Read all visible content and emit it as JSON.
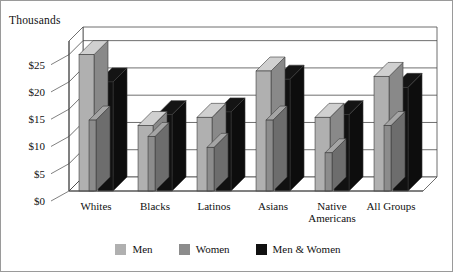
{
  "axis_caption": "Thousands",
  "chart_data": {
    "type": "bar",
    "title": "",
    "subtitle": "",
    "xlabel": "",
    "ylabel": "Thousands",
    "ylim": [
      0,
      27.5
    ],
    "yticks": [
      0,
      5,
      10,
      15,
      20,
      25
    ],
    "ytick_labels": [
      "$0",
      "$5",
      "$10",
      "$15",
      "$20",
      "$25"
    ],
    "grid": true,
    "legend_position": "bottom",
    "three_d": true,
    "categories": [
      "Whites",
      "Blacks",
      "Latinos",
      "Asians",
      "Native Americans",
      "All Groups"
    ],
    "category_lines": [
      [
        "Whites"
      ],
      [
        "Blacks"
      ],
      [
        "Latinos"
      ],
      [
        "Asians"
      ],
      [
        "Native",
        "Americans"
      ],
      [
        "All Groups"
      ]
    ],
    "series": [
      {
        "name": "Men",
        "color": "#b0b0b0",
        "values": [
          25.0,
          12.0,
          13.5,
          22.0,
          13.5,
          21.0
        ]
      },
      {
        "name": "Women",
        "color": "#8c8c8c",
        "values": [
          13.0,
          10.0,
          8.0,
          13.0,
          7.0,
          12.0
        ]
      },
      {
        "name": "Men & Women",
        "color": "#111111",
        "values": [
          20.0,
          14.0,
          14.5,
          20.5,
          14.0,
          19.0
        ]
      }
    ]
  },
  "legend": [
    {
      "label": "Men",
      "color": "#b0b0b0"
    },
    {
      "label": "Women",
      "color": "#8c8c8c"
    },
    {
      "label": "Men & Women",
      "color": "#111111"
    }
  ]
}
